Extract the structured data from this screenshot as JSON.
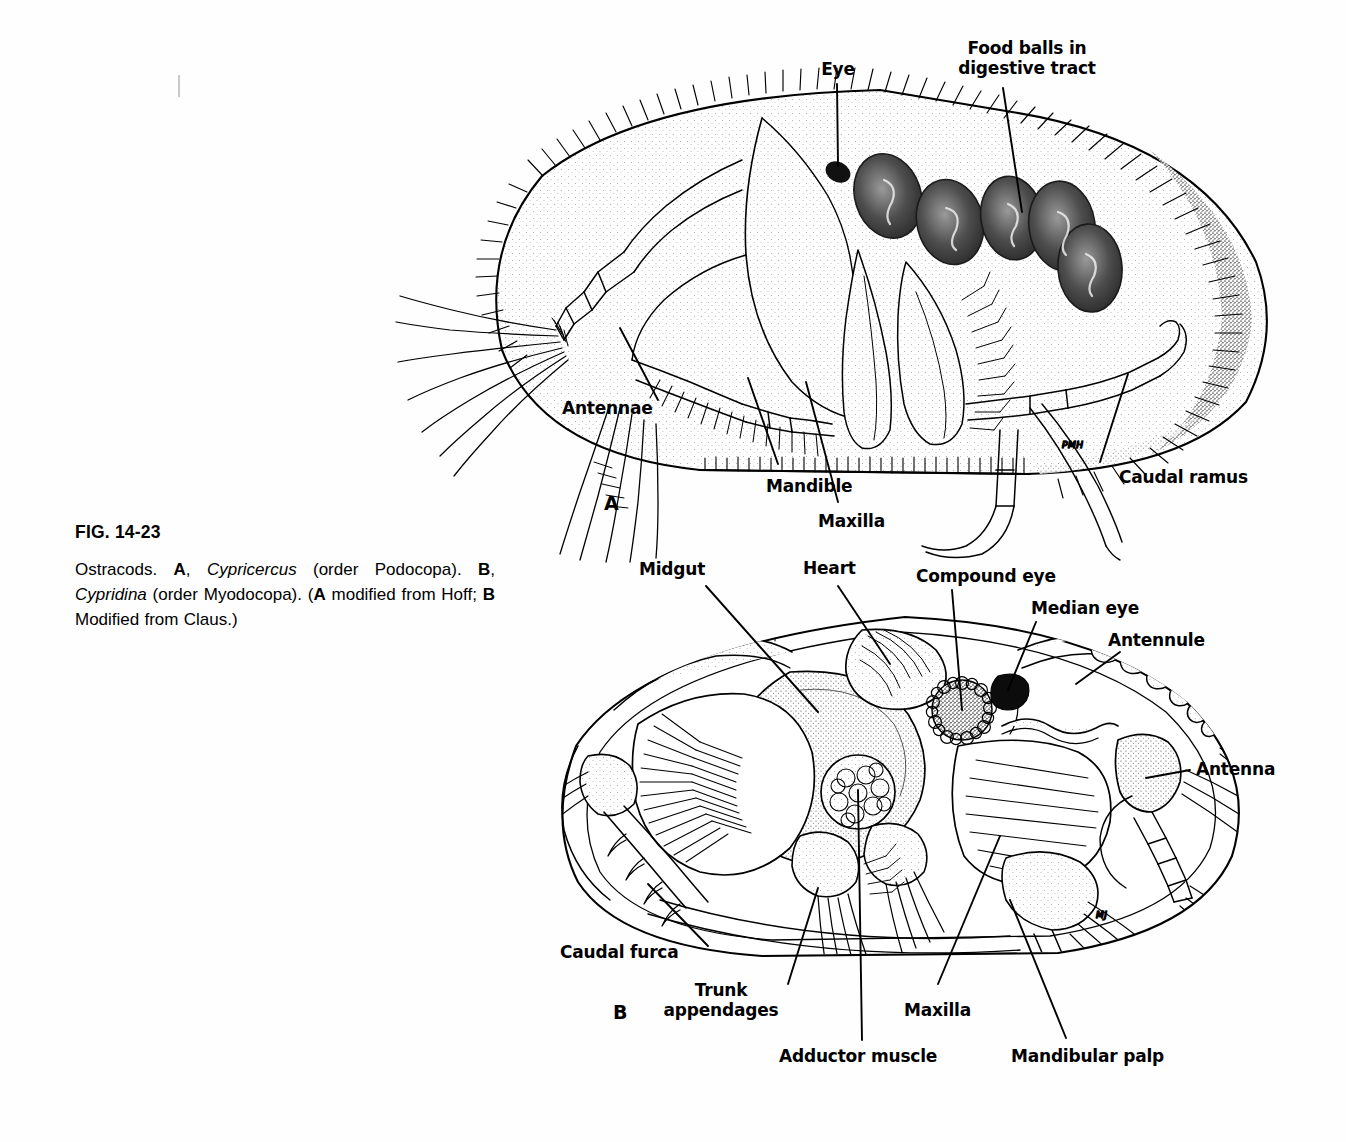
{
  "figure": {
    "number": "FIG. 14-23",
    "caption_runs": [
      {
        "t": "Ostracods.  ",
        "s": "normal"
      },
      {
        "t": "A",
        "s": "bold"
      },
      {
        "t": ", ",
        "s": "normal"
      },
      {
        "t": "Cypricercus",
        "s": "italic"
      },
      {
        "t": " (order Podocopa).  ",
        "s": "normal"
      },
      {
        "t": "B",
        "s": "bold"
      },
      {
        "t": ", ",
        "s": "normal"
      },
      {
        "t": "Cypridina",
        "s": "italic"
      },
      {
        "t": " (order Myodocopa). (",
        "s": "normal"
      },
      {
        "t": "A",
        "s": "bold"
      },
      {
        "t": " modified from Hoff; ",
        "s": "normal"
      },
      {
        "t": "B",
        "s": "bold"
      },
      {
        "t": " Modified from Claus.)",
        "s": "normal"
      }
    ],
    "caption_plain": "Ostracods.  A, Cypricercus (order Podocopa).  B, Cypridina (order Myodocopa). (A modified from Hoff; B Modified from Claus.)"
  },
  "panel_a": {
    "letter": "A",
    "species": "Cypricercus",
    "order": "Podocopa",
    "artist_signature": "PMH",
    "labels": {
      "eye": "Eye",
      "food_balls": "Food balls in\ndigestive tract",
      "antennae": "Antennae",
      "mandible": "Mandible",
      "maxilla": "Maxilla",
      "caudal_ramus": "Caudal ramus"
    }
  },
  "panel_b": {
    "letter": "B",
    "species": "Cypridina",
    "order": "Myodocopa",
    "artist_signature": "MJ",
    "labels": {
      "midgut": "Midgut",
      "heart": "Heart",
      "compound_eye": "Compound eye",
      "median_eye": "Median eye",
      "antennule": "Antennule",
      "antenna": "Antenna",
      "caudal_furca": "Caudal furca",
      "trunk_appendages": "Trunk\nappendages",
      "adductor_muscle": "Adductor muscle",
      "maxilla": "Maxilla",
      "mandibular_palp": "Mandibular palp"
    }
  },
  "colors": {
    "page_background": "#fefefe",
    "ink": "#000000",
    "stipple": "#6d6d6d",
    "crop_mark": "#c9c9c9"
  }
}
